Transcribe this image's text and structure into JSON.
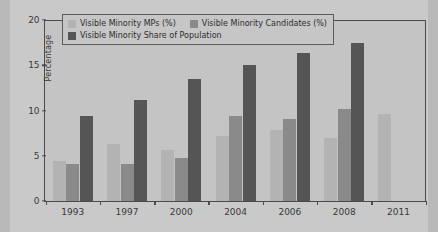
{
  "chart_data": {
    "type": "bar",
    "title": "",
    "xlabel": "",
    "ylabel": "Percentage",
    "ylim": [
      0,
      20
    ],
    "yticks": [
      0,
      5,
      10,
      15,
      20
    ],
    "grid": false,
    "legend_position": "upper-left-inside",
    "categories": [
      "1993",
      "1997",
      "2000",
      "2004",
      "2006",
      "2008",
      "2011"
    ],
    "series": [
      {
        "name": "Visible Minority MPs (%)",
        "color": "#b3b3b3",
        "values": [
          4.4,
          6.3,
          5.6,
          7.2,
          7.9,
          7.0,
          9.6
        ]
      },
      {
        "name": "Visible Minority Candidates (%)",
        "color": "#8a8a8a",
        "values": [
          4.1,
          4.1,
          4.8,
          9.4,
          9.1,
          10.2,
          null
        ]
      },
      {
        "name": "Visible Minority Share of Population",
        "color": "#555555",
        "values": [
          9.4,
          11.2,
          13.5,
          15.0,
          16.4,
          17.5,
          null
        ]
      }
    ]
  },
  "colors": {
    "page_background": "#c9c9c9",
    "plot_background": "#c4c4c4",
    "axis": "#4a4a4a",
    "text": "#3a3a3a",
    "legend_border": "#5c5c5c",
    "legend_background": "#c6c6c6"
  }
}
